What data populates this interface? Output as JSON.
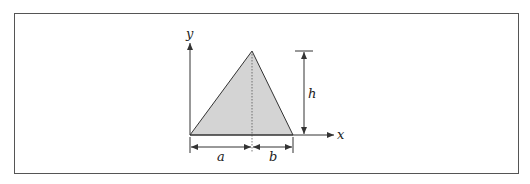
{
  "figure": {
    "labels": {
      "y_axis": "y",
      "x_axis": "x",
      "height": "h",
      "left_segment": "a",
      "right_segment": "b"
    },
    "colors": {
      "fill": "#d4d4d4",
      "stroke": "#333333",
      "frame": "#555555"
    }
  }
}
